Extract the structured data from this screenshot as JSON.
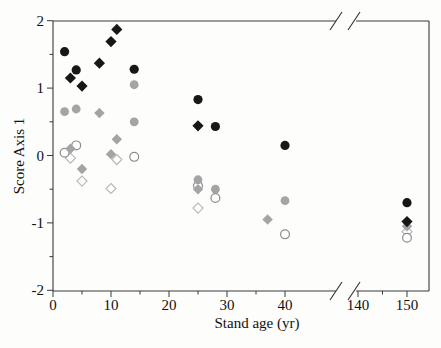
{
  "figure": {
    "kind": "scanned journal scatter plot with broken x-axis",
    "background": "#fdfdfc"
  },
  "colors": {
    "axis": "#3a3a3a",
    "tick_label": "#111111",
    "black_marker": "#171717",
    "gray_marker": "#a4a4a4",
    "open_circle_stroke": "#8c8c8c",
    "open_diamond_stroke": "#b9b9b9"
  },
  "chart_data": {
    "type": "scatter",
    "title": "",
    "xlabel": "Stand age (yr)",
    "ylabel": "Score Axis 1",
    "x_axis": {
      "tick_values": [
        0,
        10,
        20,
        30,
        40,
        140,
        150
      ],
      "tick_labels": [
        "0",
        "10",
        "20",
        "30",
        "40",
        "140",
        "150"
      ],
      "minor_tick_values": [
        5,
        15,
        25,
        35,
        145
      ],
      "axis_break_between": [
        45,
        140
      ],
      "range_left_segment": [
        0,
        47
      ],
      "range_right_segment": [
        138,
        154
      ]
    },
    "y_axis": {
      "tick_values": [
        2,
        1,
        0,
        -1,
        -2
      ],
      "tick_labels": [
        "2",
        "1",
        "0",
        "-1",
        "-2"
      ],
      "minor_tick_values": [
        1.5,
        0.5,
        -0.5,
        -1.5
      ],
      "range": [
        -2,
        2
      ]
    },
    "grid": false,
    "legend": "none",
    "series": [
      {
        "name": "open-diamond",
        "marker": "diamond",
        "fill": "#ffffff",
        "stroke": "#b9b9b9",
        "size": 5.0,
        "points": [
          [
            3,
            -0.04
          ],
          [
            5,
            -0.38
          ],
          [
            10,
            -0.49
          ],
          [
            11,
            -0.06
          ],
          [
            25,
            -0.78
          ],
          [
            150,
            -1.13
          ]
        ]
      },
      {
        "name": "open-circle",
        "marker": "circle",
        "fill": "#ffffff",
        "stroke": "#8c8c8c",
        "size": 4.4,
        "points": [
          [
            2,
            0.04
          ],
          [
            4,
            0.15
          ],
          [
            14,
            -0.02
          ],
          [
            25,
            -0.45
          ],
          [
            28,
            -0.63
          ],
          [
            40,
            -1.17
          ],
          [
            150,
            -1.22
          ]
        ]
      },
      {
        "name": "gray-circle",
        "marker": "circle",
        "fill": "#a4a4a4",
        "stroke": "none",
        "size": 4.4,
        "points": [
          [
            2,
            0.65
          ],
          [
            4,
            0.69
          ],
          [
            14,
            1.05
          ],
          [
            14,
            0.5
          ],
          [
            25,
            -0.36
          ],
          [
            28,
            -0.5
          ],
          [
            40,
            -0.67
          ]
        ]
      },
      {
        "name": "gray-diamond",
        "marker": "diamond",
        "fill": "#a4a4a4",
        "stroke": "none",
        "size": 5.2,
        "points": [
          [
            3,
            0.1
          ],
          [
            5,
            -0.2
          ],
          [
            8,
            0.63
          ],
          [
            10,
            0.02
          ],
          [
            11,
            0.24
          ],
          [
            25,
            -0.5
          ],
          [
            37,
            -0.95
          ],
          [
            150,
            -1.05
          ]
        ]
      },
      {
        "name": "black-circle",
        "marker": "circle",
        "fill": "#171717",
        "stroke": "none",
        "size": 4.6,
        "points": [
          [
            2,
            1.54
          ],
          [
            4,
            1.27
          ],
          [
            14,
            1.28
          ],
          [
            25,
            0.83
          ],
          [
            28,
            0.43
          ],
          [
            40,
            0.15
          ],
          [
            150,
            -0.7
          ]
        ]
      },
      {
        "name": "black-diamond",
        "marker": "diamond",
        "fill": "#171717",
        "stroke": "none",
        "size": 5.6,
        "points": [
          [
            3,
            1.15
          ],
          [
            5,
            1.03
          ],
          [
            8,
            1.37
          ],
          [
            10,
            1.69
          ],
          [
            11,
            1.87
          ],
          [
            25,
            0.44
          ],
          [
            150,
            -0.98
          ]
        ]
      }
    ]
  }
}
